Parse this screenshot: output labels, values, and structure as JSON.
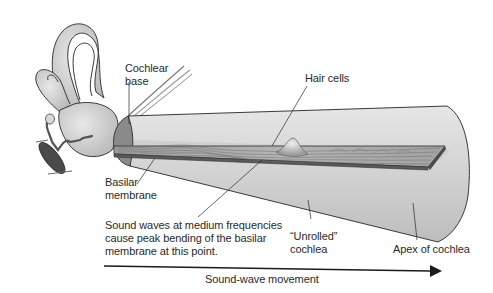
{
  "diagram": {
    "type": "anatomical-illustration",
    "colors": {
      "background": "#ffffff",
      "tube_fill": "#d4d4d4",
      "tube_shadow": "#bdbdbd",
      "membrane_top": "#a9a9a9",
      "membrane_edge": "#5a5a5a",
      "base_cap": "#8c8c8c",
      "ear_fill": "#cfcfcf",
      "line": "#333333",
      "text": "#2a2a2a"
    },
    "labels": {
      "cochlear_base_line1": "Cochlear",
      "cochlear_base_line2": "base",
      "hair_cells": "Hair cells",
      "basilar_membrane_line1": "Basilar",
      "basilar_membrane_line2": "membrane",
      "sound_waves_line1": "Sound waves at medium frequencies",
      "sound_waves_line2": "cause peak bending of the basilar",
      "sound_waves_line3": "membrane at this point.",
      "unrolled_cochlea_line1": "“Unrolled”",
      "unrolled_cochlea_line2": "cochlea",
      "apex": "Apex of cochlea",
      "arrow": "Sound-wave movement"
    }
  }
}
